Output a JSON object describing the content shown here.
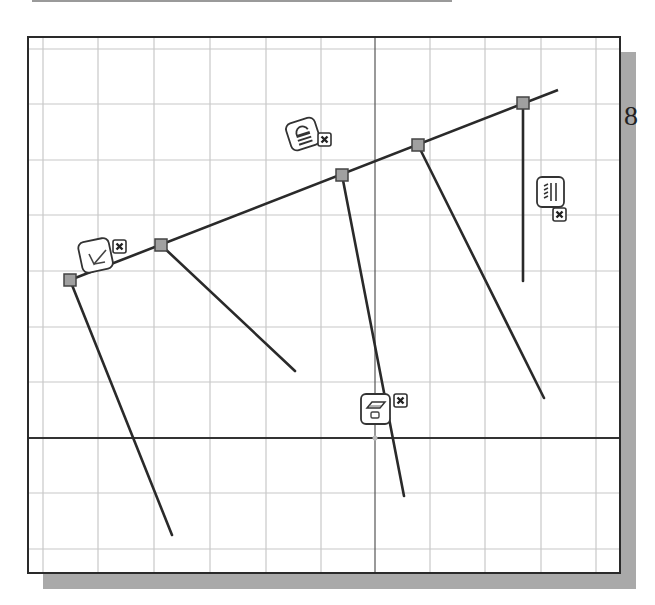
{
  "page": {
    "page_number_fragment": "8"
  },
  "canvas": {
    "background": "#ffffff",
    "frame_color": "#2a2a2a",
    "shadow_color": "#a9a9a9",
    "grid_color": "#c8c8c8",
    "axis_color": "#333333",
    "line_color": "#2a2a2a",
    "node_fill": "#a0a0a0",
    "grid_x": [
      43,
      98,
      154,
      210,
      266,
      321,
      430,
      485,
      541,
      596
    ],
    "grid_y": [
      49,
      104,
      160,
      215,
      271,
      327,
      382,
      493,
      549
    ],
    "axis_x": 375,
    "axis_y": 438
  },
  "sketch": {
    "main_line": {
      "x1": 70,
      "y1": 280,
      "x2": 558,
      "y2": 90
    },
    "nodes": [
      {
        "name": "node-1",
        "x": 70,
        "y": 280
      },
      {
        "name": "node-2",
        "x": 161,
        "y": 245
      },
      {
        "name": "node-3",
        "x": 342,
        "y": 175
      },
      {
        "name": "node-4",
        "x": 418,
        "y": 145
      },
      {
        "name": "node-5",
        "x": 523,
        "y": 103
      }
    ],
    "branch_lines": [
      {
        "name": "branch-line-1",
        "x1": 70,
        "y1": 280,
        "x2": 172,
        "y2": 535
      },
      {
        "name": "branch-line-2",
        "x1": 161,
        "y1": 245,
        "x2": 295,
        "y2": 371
      },
      {
        "name": "branch-line-3",
        "x1": 342,
        "y1": 175,
        "x2": 404,
        "y2": 496
      },
      {
        "name": "branch-line-4",
        "x1": 418,
        "y1": 145,
        "x2": 544,
        "y2": 398
      },
      {
        "name": "branch-line-5",
        "x1": 523,
        "y1": 103,
        "x2": 523,
        "y2": 281
      }
    ]
  },
  "constraints": [
    {
      "name": "perpendicular-constraint",
      "icon": "perpendicular-icon",
      "x": 80,
      "y": 240,
      "close_x": 113,
      "close_y": 240
    },
    {
      "name": "parallel-constraint",
      "icon": "parallel-lock-icon",
      "x": 288,
      "y": 120,
      "close_x": 318,
      "close_y": 133
    },
    {
      "name": "horizontal-constraint",
      "icon": "horizontal-fix-icon",
      "x": 361,
      "y": 394,
      "close_x": 394,
      "close_y": 394
    },
    {
      "name": "vertical-constraint",
      "icon": "vertical-icon",
      "x": 537,
      "y": 177,
      "close_x": 553,
      "close_y": 208
    }
  ]
}
